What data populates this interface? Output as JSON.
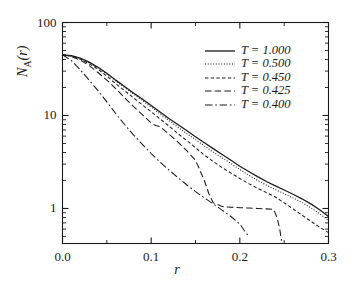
{
  "figure": {
    "ylabel": "Nᴀ(r)",
    "ylabel_main": "N",
    "ylabel_sub": "A",
    "ylabel_tail": "(r)",
    "xlabel": "r",
    "background": "#ffffff",
    "line_color": "#1a1a1a"
  },
  "axes": {
    "x": {
      "min": 0.0,
      "max": 0.3,
      "scale": "linear",
      "ticks": [
        0.0,
        0.1,
        0.2,
        0.3
      ],
      "tick_labels": [
        "0.0",
        "0.1",
        "0.2",
        "0.3"
      ],
      "minor_ticks": [
        0.05,
        0.15,
        0.25
      ]
    },
    "y": {
      "min": 0.42,
      "max": 100,
      "scale": "log",
      "ticks": [
        1,
        10,
        100
      ],
      "tick_labels": [
        "1",
        "10",
        "100"
      ]
    },
    "grid": false,
    "frame": true
  },
  "legend": {
    "position": "upper-right",
    "entries": [
      {
        "label": "T = 1.000",
        "style": "solid",
        "dash": "none"
      },
      {
        "label": "T = 0.500",
        "style": "dotted",
        "dash": "1,1.6"
      },
      {
        "label": "T = 0.450",
        "style": "dashed",
        "dash": "3.2,2.2"
      },
      {
        "label": "T = 0.425",
        "style": "longdash",
        "dash": "6,3"
      },
      {
        "label": "T = 0.400",
        "style": "dashdot",
        "dash": "7,2.6,1.6,2.6"
      }
    ]
  },
  "chart_data": {
    "type": "line",
    "title": "",
    "xlabel": "r",
    "ylabel": "N_A(r)",
    "xlim": [
      0.0,
      0.3
    ],
    "ylim": [
      0.42,
      100
    ],
    "yscale": "log",
    "xscale": "linear",
    "grid": false,
    "legend_position": "upper-right",
    "series": [
      {
        "name": "T = 1.000",
        "style": "solid",
        "x": [
          0.0,
          0.01,
          0.02,
          0.03,
          0.04,
          0.05,
          0.06,
          0.07,
          0.08,
          0.09,
          0.1,
          0.11,
          0.12,
          0.13,
          0.14,
          0.15,
          0.16,
          0.17,
          0.18,
          0.19,
          0.2,
          0.21,
          0.22,
          0.23,
          0.24,
          0.25,
          0.26,
          0.27,
          0.28,
          0.29,
          0.3
        ],
        "y": [
          45.0,
          44.0,
          41.5,
          37.5,
          33.0,
          28.5,
          24.0,
          20.5,
          17.5,
          15.0,
          12.8,
          10.9,
          9.3,
          8.0,
          6.9,
          5.9,
          5.1,
          4.4,
          3.8,
          3.3,
          2.85,
          2.5,
          2.2,
          1.95,
          1.75,
          1.58,
          1.42,
          1.27,
          1.12,
          0.97,
          0.82
        ]
      },
      {
        "name": "T = 0.500",
        "style": "dotted",
        "x": [
          0.0,
          0.01,
          0.02,
          0.03,
          0.04,
          0.05,
          0.06,
          0.07,
          0.08,
          0.09,
          0.1,
          0.11,
          0.12,
          0.13,
          0.14,
          0.15,
          0.16,
          0.17,
          0.18,
          0.19,
          0.2,
          0.21,
          0.22,
          0.23,
          0.24,
          0.25,
          0.26,
          0.27,
          0.28,
          0.29,
          0.3
        ],
        "y": [
          45.0,
          43.8,
          41.0,
          37.0,
          32.5,
          28.0,
          23.5,
          20.0,
          17.0,
          14.5,
          12.3,
          10.4,
          8.8,
          7.5,
          6.4,
          5.5,
          4.7,
          4.05,
          3.5,
          3.05,
          2.62,
          2.28,
          2.0,
          1.78,
          1.6,
          1.44,
          1.3,
          1.16,
          1.02,
          0.88,
          0.74
        ]
      },
      {
        "name": "T = 0.450",
        "style": "dashed",
        "x": [
          0.0,
          0.01,
          0.02,
          0.03,
          0.04,
          0.05,
          0.06,
          0.07,
          0.08,
          0.09,
          0.1,
          0.11,
          0.12,
          0.13,
          0.14,
          0.15,
          0.16,
          0.17,
          0.18,
          0.19,
          0.2,
          0.21,
          0.22,
          0.23,
          0.24,
          0.25,
          0.26,
          0.27,
          0.28,
          0.29,
          0.3
        ],
        "y": [
          45.0,
          43.5,
          40.5,
          36.0,
          31.5,
          26.5,
          22.0,
          18.5,
          15.5,
          13.0,
          11.0,
          9.2,
          7.7,
          6.4,
          5.4,
          4.5,
          3.75,
          3.2,
          2.75,
          2.4,
          2.1,
          1.85,
          1.65,
          1.48,
          1.33,
          1.15,
          0.99,
          0.85,
          0.73,
          0.63,
          0.55
        ]
      },
      {
        "name": "T = 0.425",
        "style": "longdash",
        "x": [
          0.0,
          0.01,
          0.02,
          0.03,
          0.04,
          0.05,
          0.06,
          0.07,
          0.08,
          0.09,
          0.1,
          0.105,
          0.11,
          0.12,
          0.13,
          0.14,
          0.15,
          0.16,
          0.165,
          0.17,
          0.18,
          0.19,
          0.2,
          0.21,
          0.22,
          0.23,
          0.238,
          0.242,
          0.245,
          0.247
        ],
        "y": [
          45.0,
          43.0,
          39.5,
          34.5,
          29.0,
          24.0,
          19.5,
          15.5,
          12.5,
          10.2,
          8.3,
          7.8,
          7.6,
          6.3,
          5.2,
          4.2,
          3.3,
          2.0,
          1.45,
          1.15,
          1.05,
          1.03,
          1.02,
          1.01,
          1.0,
          0.99,
          0.98,
          0.8,
          0.6,
          0.45
        ]
      },
      {
        "name": "T = 0.400",
        "style": "dashdot",
        "x": [
          0.0,
          0.01,
          0.02,
          0.03,
          0.04,
          0.05,
          0.06,
          0.07,
          0.08,
          0.09,
          0.1,
          0.11,
          0.12,
          0.13,
          0.14,
          0.15,
          0.16,
          0.17,
          0.18,
          0.19,
          0.2,
          0.205,
          0.21
        ],
        "y": [
          45.0,
          39.0,
          31.0,
          24.0,
          18.5,
          14.0,
          10.5,
          8.0,
          6.2,
          4.9,
          3.9,
          3.15,
          2.6,
          2.15,
          1.8,
          1.52,
          1.3,
          1.12,
          0.96,
          0.82,
          0.68,
          0.58,
          0.5
        ]
      }
    ]
  }
}
